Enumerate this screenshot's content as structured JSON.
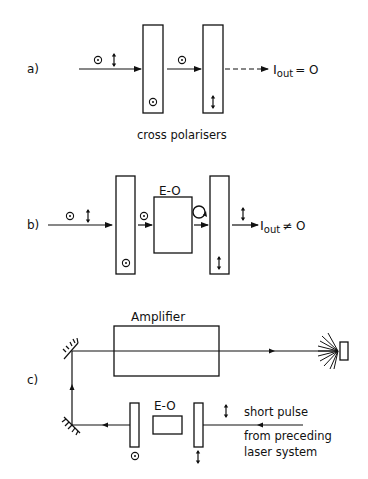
{
  "figure": {
    "panels": [
      {
        "id": "a",
        "label": "a)",
        "caption": "cross polarisers",
        "output_text": "I",
        "output_sub": "out",
        "output_rel": "= O",
        "elements": [
          "input beam (both polarisations)",
          "polariser (⊙)",
          "polariser (↕)"
        ],
        "beam_after_first": "⊙",
        "result": "I_out = 0"
      },
      {
        "id": "b",
        "label": "b)",
        "eo_label": "E-O",
        "output_text": "I",
        "output_sub": "out",
        "output_rel": "≠ O",
        "elements": [
          "input beam (both polarisations)",
          "polariser (⊙)",
          "E-O cell",
          "polariser (↕)"
        ],
        "result": "I_out ≠ 0"
      },
      {
        "id": "c",
        "label": "c)",
        "amplifier_label": "Amplifier",
        "eo_label": "E-O",
        "input_text_lines": [
          "short pulse",
          "from preceding",
          "laser system"
        ],
        "elements": [
          "amplifier",
          "target",
          "mirror",
          "mirror",
          "polariser (⊙)",
          "E-O cell",
          "polariser (↕)"
        ]
      }
    ]
  }
}
